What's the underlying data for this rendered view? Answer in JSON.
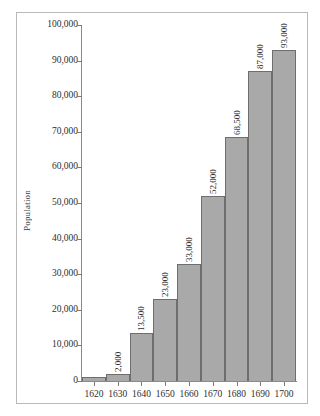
{
  "chart_data": {
    "type": "bar",
    "title": "",
    "subtitle": "",
    "xlabel": "",
    "ylabel": "Population",
    "categories": [
      "1620",
      "1630",
      "1640",
      "1650",
      "1660",
      "1670",
      "1680",
      "1690",
      "1700"
    ],
    "values": [
      1000,
      2000,
      13500,
      23000,
      33000,
      52000,
      68500,
      87000,
      93000
    ],
    "data_labels": [
      "",
      "2,000",
      "13,500",
      "23,000",
      "33,000",
      "52,000",
      "68,500",
      "87,000",
      "93,000"
    ],
    "ylim": [
      0,
      100000
    ],
    "ytick_values": [
      0,
      10000,
      20000,
      30000,
      40000,
      50000,
      60000,
      70000,
      80000,
      90000,
      100000
    ],
    "ytick_labels": [
      "0",
      "10,000",
      "20,000",
      "30,000",
      "40,000",
      "50,000",
      "60,000",
      "70,000",
      "80,000",
      "90,000",
      "100,000"
    ],
    "grid": false,
    "legend": false,
    "legend_position": "none",
    "bar_gap": 0,
    "colors": {
      "bar_fill": "#a9a9a9",
      "bar_edge": "#6e6e6e",
      "axis": "#8a8a8a",
      "text": "#2e2e2e",
      "frame": "#b9b9b9",
      "background": "#ffffff"
    }
  }
}
